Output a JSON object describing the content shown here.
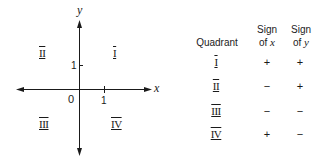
{
  "plane": {
    "x_axis_label": "x",
    "y_axis_label": "y",
    "origin_label": "0",
    "x_tick_label": "1",
    "y_tick_label": "1",
    "quadrant_labels": {
      "q1": "I",
      "q2": "II",
      "q3": "III",
      "q4": "IV"
    },
    "axis_color": "#1a1a1a"
  },
  "table": {
    "headers": {
      "quadrant": "Quadrant",
      "sign_x_line1": "Sign",
      "sign_x_line2": "of",
      "sign_x_var": "x",
      "sign_y_line1": "Sign",
      "sign_y_line2": "of",
      "sign_y_var": "y"
    },
    "rows": [
      {
        "quadrant": "I",
        "sign_x": "+",
        "sign_y": "+"
      },
      {
        "quadrant": "II",
        "sign_x": "−",
        "sign_y": "+"
      },
      {
        "quadrant": "III",
        "sign_x": "−",
        "sign_y": "−"
      },
      {
        "quadrant": "IV",
        "sign_x": "+",
        "sign_y": "−"
      }
    ]
  }
}
